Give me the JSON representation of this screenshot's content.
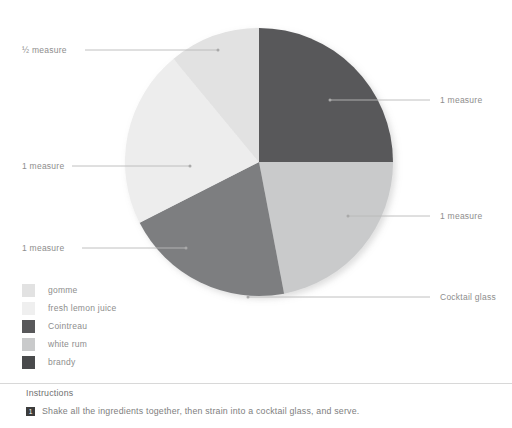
{
  "chart_data": {
    "type": "pie",
    "title": "",
    "center": {
      "x": 259,
      "y": 162
    },
    "radius": 134,
    "start_angle_deg": 0,
    "direction": "clockwise",
    "legend_position": "bottom-left",
    "categories": [
      "gomme",
      "fresh lemon juice",
      "Cointreau",
      "white rum",
      "brandy"
    ],
    "slices": [
      {
        "label": "Cointreau",
        "value": 1,
        "measure": "1 measure",
        "percent": 25.0,
        "start_deg": 0,
        "end_deg": 90,
        "color": "#58585a"
      },
      {
        "label": "white rum",
        "value": 1,
        "measure": "1 measure",
        "percent": 22.0,
        "start_deg": 90,
        "end_deg": 169.2,
        "color": "#c9cacb"
      },
      {
        "label": "brandy",
        "value": 1,
        "measure": "1 measure",
        "percent": 20.5,
        "start_deg": 169.2,
        "end_deg": 243.0,
        "color": "#7d7e80"
      },
      {
        "label": "fresh lemon juice",
        "value": 1,
        "measure": "1 measure",
        "percent": 21.5,
        "start_deg": 243.0,
        "end_deg": 320.4,
        "color": "#ededed"
      },
      {
        "label": "gomme",
        "value": 0.5,
        "measure": "½ measure",
        "percent": 11.0,
        "start_deg": 320.4,
        "end_deg": 360,
        "color": "#e2e2e2"
      }
    ],
    "values": [
      0.5,
      1,
      1,
      1,
      1
    ],
    "percents": [
      11.0,
      21.5,
      25.0,
      22.0,
      20.5
    ]
  },
  "legend": {
    "items": [
      {
        "label": "gomme",
        "color": "#e2e2e2"
      },
      {
        "label": "fresh lemon juice",
        "color": "#efefef"
      },
      {
        "label": "Cointreau",
        "color": "#58585a"
      },
      {
        "label": "white rum",
        "color": "#c9cacb"
      },
      {
        "label": "brandy",
        "color": "#494a4c"
      }
    ]
  },
  "callouts": [
    {
      "key": "gomme_label",
      "text": "½ measure",
      "side": "left"
    },
    {
      "key": "lemon_label",
      "text": "1 measure",
      "side": "left"
    },
    {
      "key": "brandy_label",
      "text": "1 measure",
      "side": "left"
    },
    {
      "key": "cointreau_label",
      "text": "1 measure",
      "side": "right"
    },
    {
      "key": "whiterum_label",
      "text": "1 measure",
      "side": "right"
    },
    {
      "key": "glass_label",
      "text": "Cocktail glass",
      "side": "right"
    }
  ],
  "instructions": {
    "heading": "Instructions",
    "steps": [
      {
        "number": "1",
        "text": "Shake all the ingredients together, then strain into a cocktail glass, and serve."
      }
    ]
  },
  "colors": {
    "text": "#8d8d8d",
    "heading": "#6f6f6f",
    "leader_line": "#b9b9b9",
    "rule": "#d8d8d8",
    "badge_bg": "#3c3c3c",
    "background": "#ffffff"
  }
}
